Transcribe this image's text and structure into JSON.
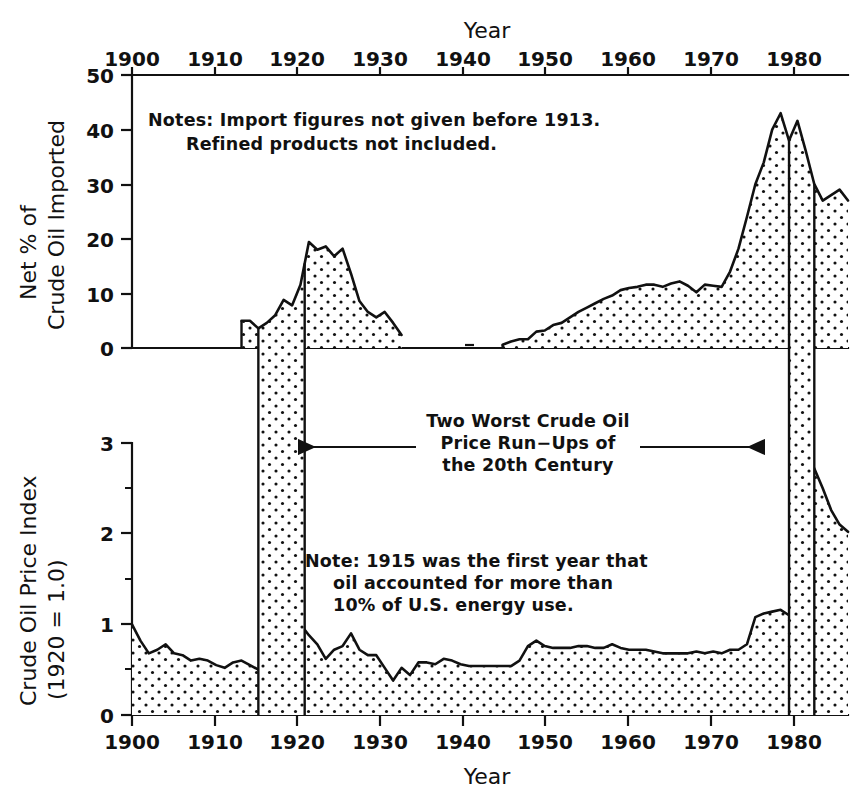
{
  "figure": {
    "top_axis_title": "Year",
    "bottom_axis_title": "Year",
    "top_ylabel_line1": "Net % of",
    "top_ylabel_line2": "Crude Oil Imported",
    "bottom_ylabel_line1": "Crude Oil Price Index",
    "bottom_ylabel_line2": "(1920 = 1.0)",
    "note_top_line1": "Notes: Import figures not given before 1913.",
    "note_top_line2": "Refined products not included.",
    "note_bottom_line1": "Note: 1915 was the first year that",
    "note_bottom_line2": "oil accounted  for more than",
    "note_bottom_line3": "10% of U.S. energy use.",
    "annotation_line1": "Two Worst Crude Oil",
    "annotation_line2": "Price Run−Ups of",
    "annotation_line3": "the 20th Century",
    "ink_color": "#111111",
    "background_color": "#ffffff",
    "fill_pattern": "dotted-stipple"
  },
  "chart_data": [
    {
      "type": "area",
      "id": "net-percent-crude-oil-imported",
      "title": "",
      "xlabel": "Year",
      "ylabel": "Net % of Crude Oil Imported",
      "xlim": [
        1900,
        1985
      ],
      "ylim": [
        0,
        50
      ],
      "xticks": [
        1900,
        1910,
        1920,
        1930,
        1940,
        1950,
        1960,
        1970,
        1980
      ],
      "yticks": [
        0,
        10,
        20,
        30,
        40,
        50
      ],
      "grid": false,
      "legend": null,
      "notes": [
        "Import figures not given before 1913.",
        "Refined products not included."
      ],
      "segments": [
        {
          "name": "1913-1932",
          "x": [
            1913,
            1914,
            1915,
            1916,
            1917,
            1918,
            1919,
            1920,
            1921,
            1922,
            1923,
            1924,
            1925,
            1926,
            1927,
            1928,
            1929,
            1930,
            1931,
            1932
          ],
          "y": [
            5.0,
            5.0,
            3.6,
            4.6,
            6.0,
            8.8,
            7.8,
            11.6,
            19.4,
            18.0,
            18.6,
            16.8,
            18.2,
            13.6,
            8.6,
            6.6,
            5.6,
            6.6,
            4.6,
            2.4
          ]
        },
        {
          "name": "1944-1985",
          "x": [
            1944,
            1945,
            1946,
            1947,
            1948,
            1949,
            1950,
            1951,
            1952,
            1953,
            1954,
            1955,
            1956,
            1957,
            1958,
            1959,
            1960,
            1961,
            1962,
            1963,
            1964,
            1965,
            1966,
            1967,
            1968,
            1969,
            1970,
            1971,
            1972,
            1973,
            1974,
            1975,
            1976,
            1977,
            1978,
            1979,
            1980,
            1981,
            1982,
            1983,
            1984,
            1985
          ],
          "y": [
            0.6,
            1.2,
            1.6,
            1.6,
            3.0,
            3.2,
            4.2,
            4.6,
            5.6,
            6.6,
            7.4,
            8.2,
            9.0,
            9.6,
            10.6,
            11.0,
            11.2,
            11.6,
            11.6,
            11.2,
            11.8,
            12.2,
            11.4,
            10.2,
            11.6,
            11.4,
            11.2,
            14.0,
            18.2,
            24.0,
            30.0,
            34.0,
            40.0,
            43.0,
            38.0,
            41.6,
            36.0,
            30.0,
            27.0,
            28.0,
            29.0,
            27.0
          ]
        }
      ],
      "gap_note": "No data plotted 1933-1943"
    },
    {
      "type": "area",
      "id": "crude-oil-price-index",
      "title": "",
      "xlabel": "Year",
      "ylabel": "Crude Oil Price Index (1920 = 1.0)",
      "xlim": [
        1900,
        1985
      ],
      "ylim": [
        0,
        3
      ],
      "xticks": [
        1900,
        1910,
        1920,
        1930,
        1940,
        1950,
        1960,
        1970,
        1980
      ],
      "yticks": [
        0,
        1,
        2,
        3
      ],
      "yticks_minor": [
        0.5,
        1.5,
        2.5
      ],
      "grid": false,
      "legend": null,
      "notes": [
        "1915 was the first year that oil accounted for more than 10% of U.S. energy use."
      ],
      "x": [
        1900,
        1901,
        1902,
        1903,
        1904,
        1905,
        1906,
        1907,
        1908,
        1909,
        1910,
        1911,
        1912,
        1913,
        1914,
        1915,
        1916,
        1917,
        1918,
        1919,
        1920,
        1921,
        1922,
        1923,
        1924,
        1925,
        1926,
        1927,
        1928,
        1929,
        1930,
        1931,
        1932,
        1933,
        1934,
        1935,
        1936,
        1937,
        1938,
        1939,
        1940,
        1941,
        1942,
        1943,
        1944,
        1945,
        1946,
        1947,
        1948,
        1949,
        1950,
        1951,
        1952,
        1953,
        1954,
        1955,
        1956,
        1957,
        1958,
        1959,
        1960,
        1961,
        1962,
        1963,
        1964,
        1965,
        1966,
        1967,
        1968,
        1969,
        1970,
        1971,
        1972,
        1973,
        1974,
        1975,
        1976,
        1977,
        1978,
        1979,
        1980,
        1981,
        1982,
        1983,
        1984,
        1985
      ],
      "y": [
        1.0,
        0.82,
        0.68,
        0.72,
        0.78,
        0.68,
        0.66,
        0.6,
        0.62,
        0.6,
        0.55,
        0.52,
        0.58,
        0.6,
        0.55,
        0.5,
        0.62,
        0.72,
        0.72,
        0.72,
        1.0,
        0.88,
        0.78,
        0.62,
        0.72,
        0.76,
        0.9,
        0.72,
        0.66,
        0.66,
        0.52,
        0.38,
        0.52,
        0.44,
        0.58,
        0.58,
        0.56,
        0.62,
        0.6,
        0.56,
        0.54,
        0.54,
        0.54,
        0.54,
        0.54,
        0.54,
        0.6,
        0.76,
        0.82,
        0.76,
        0.74,
        0.74,
        0.74,
        0.76,
        0.76,
        0.74,
        0.74,
        0.78,
        0.74,
        0.72,
        0.72,
        0.72,
        0.7,
        0.68,
        0.68,
        0.68,
        0.68,
        0.7,
        0.68,
        0.7,
        0.68,
        0.72,
        0.72,
        0.78,
        1.08,
        1.12,
        1.14,
        1.16,
        1.1,
        1.42,
        2.26,
        2.72,
        2.5,
        2.26,
        2.1,
        2.02
      ]
    }
  ],
  "highlight_bands": [
    {
      "name": "first-run-up",
      "start": 1915,
      "end": 1920.5,
      "label": "1915-1920"
    },
    {
      "name": "second-run-up",
      "start": 1978,
      "end": 1981,
      "label": "1978-1981"
    }
  ],
  "annotation": {
    "text_lines": [
      "Two Worst Crude Oil",
      "Price Run−Ups of",
      "the 20th Century"
    ],
    "arrow_left_target": 1920.5,
    "arrow_right_target": 1978,
    "arrow_y_value": 2.7
  }
}
